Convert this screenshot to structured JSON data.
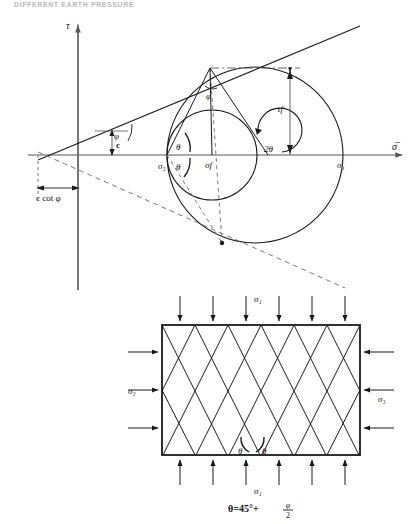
{
  "figure": {
    "header_text": "DIFFERENT EARTH PRESSURE",
    "top_panel": {
      "name": "mohr-circle-failure-envelope",
      "axes": {
        "y_label": "τ",
        "x_label": "σ̅"
      },
      "labels": {
        "phi_envelope": "φ",
        "cohesion": "c",
        "c_cot_phi": "c cot φ",
        "sigma3": "σ₃",
        "sigma_f": "σf",
        "sigma1": "σ₁",
        "tau_f": "τf",
        "two_theta": "2θ",
        "theta_upper": "θ",
        "theta_lower": "θ",
        "phi_at_tangent": "φ"
      }
    },
    "bottom_panel": {
      "name": "failure-plane-block",
      "labels": {
        "sigma1_top": "σ₁",
        "sigma1_bottom": "σ₁",
        "sigma3_left": "σ₃",
        "sigma3_right": "σ₃",
        "theta_left": "θ",
        "theta_right": "θ",
        "formula": "θ=45°+"
      },
      "formula_fraction": {
        "numerator": "φ",
        "denominator": "2"
      }
    },
    "colors": {
      "line": "#1a1a1a",
      "axis": "#555555",
      "dashed": "#7a7a7a",
      "background": "#ffffff",
      "header": "#b9b9b9"
    }
  }
}
